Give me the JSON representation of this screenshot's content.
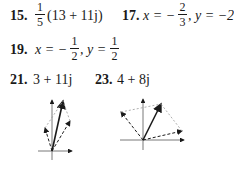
{
  "answers": [
    {
      "number": "15.",
      "frac_num": "1",
      "frac_den": "5",
      "rest": "(13 + 11j)"
    },
    {
      "number": "17.",
      "lhs_x": "x = −",
      "frac_num": "2",
      "frac_den": "3",
      "rest": ", y = −2"
    },
    {
      "number": "19.",
      "lhs_x": "x = −",
      "frac_num": "1",
      "frac_den": "2",
      "mid": ", y =",
      "frac2_num": "1",
      "frac2_den": "2"
    },
    {
      "number": "21.",
      "value": "3 + 11j"
    },
    {
      "number": "23.",
      "value": "4 + 8j"
    }
  ],
  "figures": [
    {
      "label": "vector-diagram-21",
      "description": "Parallelogram addition of two dashed vectors giving resultant 3 + 11j"
    },
    {
      "label": "vector-diagram-23",
      "description": "Parallelogram addition of two dashed vectors giving resultant 4 + 8j"
    }
  ],
  "colors": {
    "ink": "#1a1a1a",
    "dashed_light": "#9a9a9a"
  }
}
